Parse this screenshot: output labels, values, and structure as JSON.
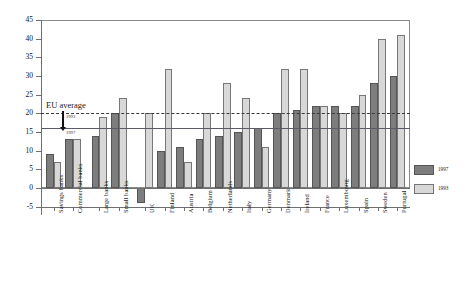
{
  "chart_data": {
    "type": "bar",
    "title": "",
    "xlabel": "",
    "ylabel": "",
    "ylim": [
      -5,
      45
    ],
    "ytick_step": 5,
    "grid": false,
    "legend_position": "right-bottom",
    "categories": [
      "Savings banks",
      "Commercial banks",
      "Large banks",
      "Small banks",
      "UK",
      "Finland",
      "Austria",
      "Belgium",
      "Netherlands",
      "Italy",
      "Germany",
      "Denmark",
      "Ireland",
      "France",
      "Luxembourg",
      "Spain",
      "Sweden",
      "Portugal"
    ],
    "yticks": [
      "-5",
      "0",
      "5",
      "10",
      "15",
      "20",
      "25",
      "30",
      "35",
      "40",
      "45"
    ],
    "series": [
      {
        "name": "1997",
        "color": "#7d7d7d",
        "values": [
          9,
          13,
          14,
          20,
          -4,
          10,
          11,
          13,
          14,
          15,
          16,
          20,
          21,
          22,
          22,
          22,
          28,
          30
        ]
      },
      {
        "name": "1993",
        "color": "#d8d8d8",
        "values": [
          7,
          13,
          19,
          24,
          20,
          32,
          7,
          20,
          28,
          24,
          11,
          32,
          32,
          22,
          20,
          25,
          40,
          41
        ]
      }
    ],
    "group_breaks": [
      2,
      4
    ],
    "reference_lines": [
      {
        "name": "EU average 1993",
        "value": 20,
        "style": "dashed",
        "color": "#3a3a3a",
        "label": "1993"
      },
      {
        "name": "EU average 1997",
        "value": 16,
        "style": "solid",
        "color": "#5a5a68",
        "label": "1997"
      }
    ],
    "annotations": [
      {
        "name": "eu-average",
        "text": "EU average"
      }
    ]
  },
  "legend": {
    "items": [
      {
        "label": "1997"
      },
      {
        "label": "1993"
      }
    ]
  }
}
